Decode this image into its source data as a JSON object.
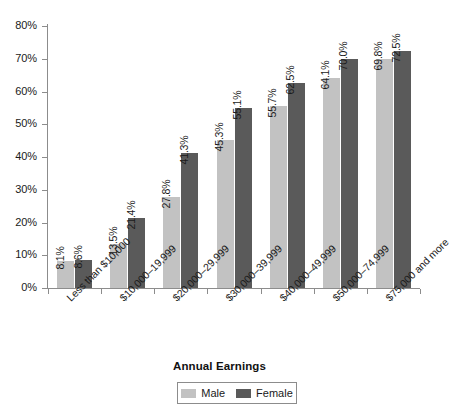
{
  "chart_data": {
    "type": "bar",
    "title": "",
    "subtitle": "",
    "xlabel": "Annual Earnings",
    "ylabel": "",
    "ylim": [
      0,
      80
    ],
    "ytick_labels": [
      "0%",
      "10%",
      "20%",
      "30%",
      "40%",
      "50%",
      "60%",
      "70%",
      "80%"
    ],
    "ytick_values": [
      0,
      10,
      20,
      30,
      40,
      50,
      60,
      70,
      80
    ],
    "grid": false,
    "legend_position": "bottom",
    "categories": [
      "Less than $10,000",
      "$10,000–19,999",
      "$20,000–29,999",
      "$30,000–39,999",
      "$40,000–49,999",
      "$50,000–74,999",
      "$75,000 and more"
    ],
    "series": [
      {
        "name": "Male",
        "color": "#c2c2c2",
        "values": [
          8.1,
          13.5,
          27.8,
          45.3,
          55.7,
          64.1,
          69.8
        ],
        "labels": [
          "8.1%",
          "13.5%",
          "27.8%",
          "45.3%",
          "55.7%",
          "64.1%",
          "69.8%"
        ]
      },
      {
        "name": "Female",
        "color": "#5a5a5a",
        "values": [
          8.6,
          21.4,
          41.3,
          55.1,
          62.5,
          70.0,
          72.5
        ],
        "labels": [
          "8.6%",
          "21.4%",
          "41.3%",
          "55.1%",
          "62.5%",
          "70.0%",
          "72.5%"
        ]
      }
    ]
  },
  "legend": {
    "items": [
      {
        "label": "Male",
        "color": "#c2c2c2"
      },
      {
        "label": "Female",
        "color": "#5a5a5a"
      }
    ]
  }
}
